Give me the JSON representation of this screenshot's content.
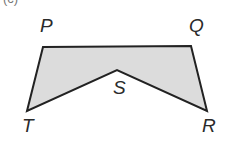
{
  "figure": {
    "part_label": "(c)",
    "shape": {
      "type": "concave pentagon",
      "fill": "#dcdcdc",
      "stroke": "#222222",
      "vertices_order": [
        "P",
        "Q",
        "R",
        "S",
        "T"
      ]
    },
    "vertices": {
      "P": {
        "label": "P"
      },
      "Q": {
        "label": "Q"
      },
      "R": {
        "label": "R"
      },
      "S": {
        "label": "S"
      },
      "T": {
        "label": "T"
      }
    }
  }
}
